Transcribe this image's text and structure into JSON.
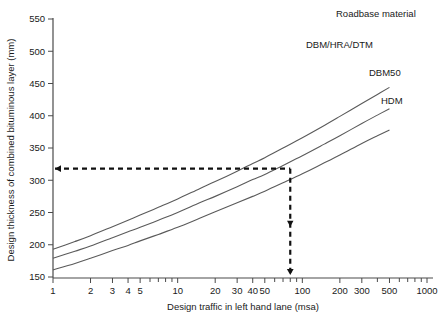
{
  "chart_data": {
    "type": "line",
    "title": "",
    "xlabel": "Design traffic in left hand lane (msa)",
    "ylabel": "Design thickness of combined bituminous layer (mm)",
    "xscale": "log",
    "yscale": "linear",
    "xlim": [
      1,
      1000
    ],
    "ylim": [
      150,
      550
    ],
    "grid": false,
    "legend_position": "inline-right",
    "legend_title": "Roadbase material",
    "x_tick_labels": [
      "1",
      "2",
      "3",
      "4",
      "5",
      "10",
      "20",
      "30",
      "40",
      "50",
      "100",
      "200",
      "300",
      "500",
      "1000"
    ],
    "x_tick_values": [
      1,
      2,
      3,
      4,
      5,
      10,
      20,
      30,
      40,
      50,
      100,
      200,
      300,
      500,
      1000
    ],
    "x_minor_ticks": [
      6,
      7,
      8,
      9,
      60,
      70,
      80,
      90,
      400,
      600,
      700,
      800,
      900
    ],
    "y_tick_labels": [
      "150",
      "200",
      "250",
      "300",
      "350",
      "400",
      "450",
      "500",
      "550"
    ],
    "y_tick_values": [
      150,
      200,
      250,
      300,
      350,
      400,
      450,
      500,
      550
    ],
    "series": [
      {
        "name": "DBM/HRA/DTM",
        "label": "DBM/HRA/DTM",
        "x": [
          1,
          1.5,
          2,
          3,
          4,
          5,
          7,
          10,
          15,
          20,
          30,
          40,
          50,
          70,
          100,
          150,
          200,
          300,
          400,
          500
        ],
        "values": [
          193,
          205,
          214,
          228,
          238,
          246,
          258,
          271,
          287,
          298,
          314,
          326,
          335,
          350,
          366,
          385,
          399,
          419,
          433,
          444
        ]
      },
      {
        "name": "DBM50",
        "label": "DBM50",
        "x": [
          1,
          1.5,
          2,
          3,
          4,
          5,
          7,
          10,
          15,
          20,
          30,
          40,
          50,
          70,
          100,
          150,
          200,
          300,
          400,
          500
        ],
        "values": [
          179,
          190,
          198,
          211,
          220,
          227,
          238,
          250,
          265,
          275,
          290,
          301,
          309,
          323,
          338,
          356,
          369,
          388,
          401,
          411
        ]
      },
      {
        "name": "HDM",
        "label": "HDM",
        "x": [
          1,
          1.5,
          2,
          3,
          4,
          5,
          7,
          10,
          15,
          20,
          30,
          40,
          50,
          70,
          100,
          150,
          200,
          300,
          400,
          500
        ],
        "values": [
          161,
          171,
          179,
          191,
          199,
          206,
          216,
          227,
          241,
          251,
          265,
          275,
          283,
          296,
          310,
          327,
          339,
          357,
          369,
          378
        ]
      }
    ],
    "annotations": [
      {
        "name": "design-construction-lines",
        "type": "dashed-crosshair",
        "x_value": 80,
        "y_value": 318,
        "from_axis_x": 1,
        "from_axis_y": 150,
        "arrow_left": true,
        "arrow_down": true
      }
    ],
    "colors": {
      "background": "#ffffff",
      "axis": "#4a4a4a",
      "curve": "#5a5a5a",
      "text": "#1a1a1a",
      "construction_line": "#111111"
    }
  }
}
